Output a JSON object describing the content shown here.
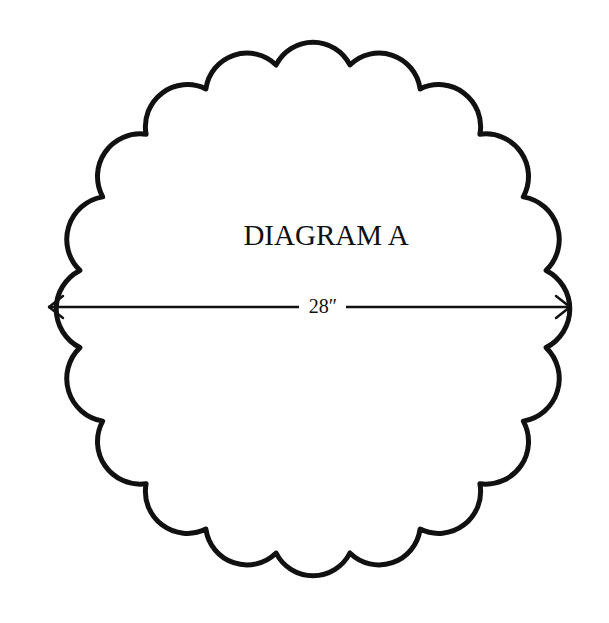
{
  "diagram": {
    "title": "DIAGRAM A",
    "shape": "scalloped-circle",
    "scallop_count": 20,
    "dimension": {
      "label": "28″",
      "type": "diameter",
      "orientation": "horizontal",
      "arrowheads": "both-ends"
    },
    "colors": {
      "stroke": "#111111",
      "background": "#ffffff"
    }
  }
}
